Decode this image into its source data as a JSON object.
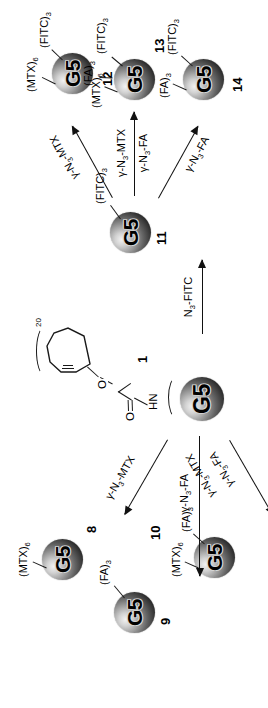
{
  "figure": {
    "kind": "chemical-reaction-scheme",
    "orientation": "rotated-90-ccw",
    "core_label": "G5"
  },
  "compounds": [
    {
      "id": "1",
      "number": "1",
      "core": "G5",
      "substituents": [],
      "linker": {
        "amide_label": "HN",
        "carbonyl_label": "O",
        "ether_label": "O",
        "repeat_count": "20",
        "ring": "cyclooctyne"
      }
    },
    {
      "id": "8",
      "number": "8",
      "core": "G5",
      "substituents": [
        "(MTX)6"
      ]
    },
    {
      "id": "9",
      "number": "9",
      "core": "G5",
      "substituents": [
        "(FA)3"
      ]
    },
    {
      "id": "10",
      "number": "10",
      "core": "G5",
      "substituents": [
        "(MTX)6",
        "(FA)3"
      ]
    },
    {
      "id": "11",
      "number": "11",
      "core": "G5",
      "substituents": [
        "(FITC)3"
      ]
    },
    {
      "id": "12",
      "number": "12",
      "core": "G5",
      "substituents": [
        "(MTX)6",
        "(FITC)3"
      ]
    },
    {
      "id": "13",
      "number": "13",
      "core": "G5",
      "substituents": [
        "(MTX)6",
        "(FA)3",
        "(FITC)3"
      ]
    },
    {
      "id": "14",
      "number": "14",
      "core": "G5",
      "substituents": [
        "(FA)3",
        "(FITC)3"
      ]
    }
  ],
  "substituent_text": {
    "mtx6": {
      "name": "(MTX)",
      "sub": "6"
    },
    "fa3": {
      "name": "(FA)",
      "sub": "3"
    },
    "fitc3": {
      "name": "(FITC)",
      "sub": "3"
    }
  },
  "reactions": [
    {
      "id": "r1-8",
      "from": "1",
      "to": "8",
      "reagent_lines": [
        {
          "pre": "γ-N",
          "sub": "3",
          "post": "-MTX"
        }
      ]
    },
    {
      "id": "r1-9",
      "from": "1",
      "to": "9",
      "reagent_lines": [
        {
          "pre": "γ-N",
          "sub": "3",
          "post": "-FA"
        }
      ]
    },
    {
      "id": "r1-10",
      "from": "1",
      "to": "10",
      "reagent_lines": [
        {
          "pre": "γ-N",
          "sub": "3",
          "post": "-MTX"
        },
        {
          "pre": "γ-N",
          "sub": "3",
          "post": "-FA"
        }
      ]
    },
    {
      "id": "r1-11",
      "from": "1",
      "to": "11",
      "reagent_lines": [
        {
          "pre": "N",
          "sub": "3",
          "post": "-FITC"
        }
      ]
    },
    {
      "id": "r11-12",
      "from": "11",
      "to": "12",
      "reagent_lines": [
        {
          "pre": "γ-N",
          "sub": "3",
          "post": "-MTX"
        }
      ]
    },
    {
      "id": "r11-13",
      "from": "11",
      "to": "13",
      "reagent_lines": [
        {
          "pre": "γ-N",
          "sub": "3",
          "post": "-MTX"
        },
        {
          "pre": "γ-N",
          "sub": "3",
          "post": "-FA"
        }
      ]
    },
    {
      "id": "r11-14",
      "from": "11",
      "to": "14",
      "reagent_lines": [
        {
          "pre": "γ-N",
          "sub": "3",
          "post": "-FA"
        }
      ]
    }
  ],
  "colors": {
    "ink": "#111111",
    "background": "#ffffff",
    "sphere_highlight": "#f2f2f2",
    "sphere_shadow": "#141414"
  }
}
